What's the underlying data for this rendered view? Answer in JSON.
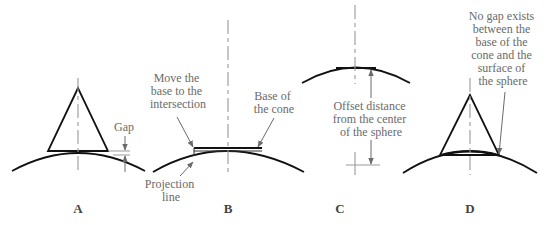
{
  "figure": {
    "top_cutoff_text": "",
    "panels": [
      {
        "id": "A",
        "label": "A",
        "annotations": [
          {
            "name": "gap",
            "lines": [
              "Gap"
            ]
          }
        ]
      },
      {
        "id": "B",
        "label": "B",
        "annotations": [
          {
            "name": "move-base",
            "lines": [
              "Move the",
              "base to the",
              "intersection"
            ]
          },
          {
            "name": "base-of-cone",
            "lines": [
              "Base of",
              "the cone"
            ]
          },
          {
            "name": "projection-line",
            "lines": [
              "Projection",
              "line"
            ]
          }
        ]
      },
      {
        "id": "C",
        "label": "C",
        "annotations": [
          {
            "name": "offset-distance",
            "lines": [
              "Offset distance",
              "from the center",
              "of the sphere"
            ]
          }
        ]
      },
      {
        "id": "D",
        "label": "D",
        "annotations": [
          {
            "name": "no-gap",
            "lines": [
              "No gap exists",
              "between the",
              "base of the",
              "cone and the",
              "surface of",
              "the sphere"
            ]
          }
        ]
      }
    ]
  },
  "colors": {
    "line": "#111111",
    "annotation": "#6a6a6a",
    "centerline": "#999999",
    "background": "#ffffff"
  }
}
